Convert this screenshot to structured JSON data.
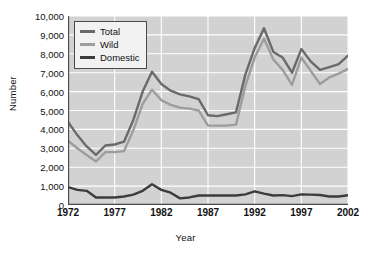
{
  "chart_data": {
    "type": "line",
    "title": "",
    "xlabel": "Year",
    "ylabel": "Number",
    "xlim": [
      1972,
      2002
    ],
    "ylim": [
      0,
      10000
    ],
    "grid": true,
    "legend_position": "top-left",
    "xticks": [
      "1972",
      "1977",
      "1982",
      "1987",
      "1992",
      "1997",
      "2002"
    ],
    "xtick_values": [
      1972,
      1977,
      1982,
      1987,
      1992,
      1997,
      2002
    ],
    "yticks": [
      "0",
      "1,000",
      "2,000",
      "3,000",
      "4,000",
      "5,000",
      "6,000",
      "7,000",
      "8,000",
      "9,000",
      "10,000"
    ],
    "ytick_values": [
      0,
      1000,
      2000,
      3000,
      4000,
      5000,
      6000,
      7000,
      8000,
      9000,
      10000
    ],
    "x": [
      1972,
      1973,
      1974,
      1975,
      1976,
      1977,
      1978,
      1979,
      1980,
      1981,
      1982,
      1983,
      1984,
      1985,
      1986,
      1987,
      1988,
      1989,
      1990,
      1991,
      1992,
      1993,
      1994,
      1995,
      1996,
      1997,
      1998,
      1999,
      2000,
      2001,
      2002
    ],
    "series": [
      {
        "name": "Total",
        "color": "#6a6a6a",
        "values": [
          4400,
          3700,
          3100,
          2650,
          3150,
          3200,
          3350,
          4500,
          6000,
          7050,
          6400,
          6050,
          5850,
          5750,
          5600,
          4750,
          4700,
          4800,
          4900,
          6900,
          8300,
          9350,
          8100,
          7800,
          7000,
          8250,
          7600,
          7150,
          7300,
          7450,
          7900
        ]
      },
      {
        "name": "Wild",
        "color": "#9d9d9d",
        "values": [
          3400,
          3000,
          2650,
          2300,
          2800,
          2800,
          2850,
          3950,
          5350,
          6100,
          5550,
          5300,
          5150,
          5100,
          5000,
          4200,
          4200,
          4200,
          4250,
          6300,
          7800,
          8800,
          7700,
          7150,
          6350,
          7800,
          7100,
          6400,
          6750,
          6950,
          7200
        ]
      },
      {
        "name": "Domestic",
        "color": "#3c3c3c",
        "values": [
          950,
          800,
          750,
          400,
          400,
          400,
          450,
          550,
          750,
          1100,
          800,
          650,
          350,
          400,
          500,
          500,
          500,
          500,
          500,
          560,
          720,
          600,
          500,
          520,
          470,
          560,
          550,
          530,
          450,
          450,
          520
        ]
      }
    ]
  },
  "legend": {
    "items": [
      {
        "label": "Total",
        "color": "#6a6a6a"
      },
      {
        "label": "Wild",
        "color": "#9d9d9d"
      },
      {
        "label": "Domestic",
        "color": "#3c3c3c"
      }
    ]
  },
  "style": {
    "plot_background": "#d2d2d2",
    "grid_color": "#ffffff",
    "axis_color": "#4a4a4a",
    "page_background": "#ffffff"
  }
}
